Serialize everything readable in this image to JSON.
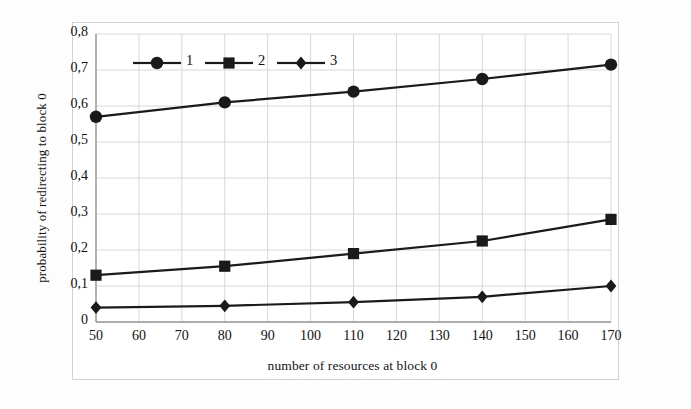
{
  "figure": {
    "background_color": "#ffffff",
    "frame_color": "#d2d2d2",
    "line_color": "#1a1a1a",
    "grid_color": "#d8d8d8"
  },
  "chart_data": {
    "type": "line",
    "title": "",
    "xlabel": "number of resources at block 0",
    "ylabel": "probability of redirecting to block 0",
    "xlim": [
      50,
      170
    ],
    "ylim": [
      0,
      0.8
    ],
    "x": [
      50,
      80,
      110,
      140,
      170
    ],
    "xticks": [
      "50",
      "60",
      "70",
      "80",
      "90",
      "100",
      "110",
      "120",
      "130",
      "140",
      "150",
      "160",
      "170"
    ],
    "xtick_values": [
      50,
      60,
      70,
      80,
      90,
      100,
      110,
      120,
      130,
      140,
      150,
      160,
      170
    ],
    "yticks": [
      "0",
      "0,1",
      "0,2",
      "0,3",
      "0,4",
      "0,5",
      "0,6",
      "0,7",
      "0,8"
    ],
    "ytick_values": [
      0,
      0.1,
      0.2,
      0.3,
      0.4,
      0.5,
      0.6,
      0.7,
      0.8
    ],
    "decimal_separator": ",",
    "grid": true,
    "legend_position": "top-left-inside",
    "series": [
      {
        "name": "1",
        "marker": "circle",
        "values": [
          0.57,
          0.61,
          0.64,
          0.675,
          0.715
        ]
      },
      {
        "name": "2",
        "marker": "square",
        "values": [
          0.13,
          0.155,
          0.19,
          0.225,
          0.285
        ]
      },
      {
        "name": "3",
        "marker": "diamond",
        "values": [
          0.04,
          0.045,
          0.055,
          0.07,
          0.1
        ]
      }
    ]
  },
  "legend": {
    "items": [
      {
        "label": "1",
        "marker": "circle"
      },
      {
        "label": "2",
        "marker": "square"
      },
      {
        "label": "3",
        "marker": "diamond"
      }
    ]
  }
}
